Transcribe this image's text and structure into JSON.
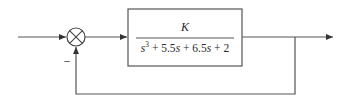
{
  "diagram": {
    "type": "feedback-control-block-diagram",
    "summing_junction": {
      "feedback_sign": "–"
    },
    "plant": {
      "numerator": "K",
      "denominator": {
        "term1_base": "s",
        "term1_exp": "3",
        "term2": " + 5.5",
        "term2_var": "s",
        "term3": " + 6.5",
        "term3_var": "s",
        "term4": " + 2"
      },
      "denominator_full": "s^3 + 5.5s + 6.5s + 2"
    },
    "feedback": "unity",
    "colors": {
      "line": "#555555",
      "text": "#2a2a2a"
    }
  }
}
